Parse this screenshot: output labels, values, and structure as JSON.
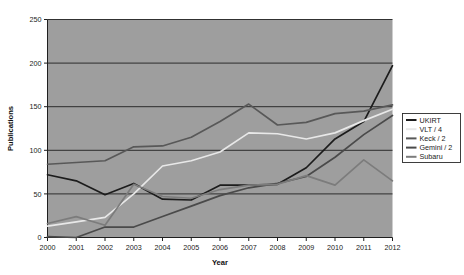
{
  "chart_data": {
    "type": "line",
    "title": "",
    "xlabel": "Year",
    "ylabel": "Publications",
    "x": [
      2000,
      2001,
      2002,
      2003,
      2004,
      2005,
      2006,
      2007,
      2008,
      2009,
      2010,
      2011,
      2012
    ],
    "categories": [
      "2000",
      "2001",
      "2002",
      "2003",
      "2004",
      "2005",
      "2006",
      "2007",
      "2008",
      "2009",
      "2010",
      "2011",
      "2012"
    ],
    "xlim": [
      2000,
      2012
    ],
    "ylim": [
      0,
      250
    ],
    "yticks": [
      0,
      50,
      100,
      150,
      200,
      250
    ],
    "ytick_labels": [
      "0",
      "50",
      "100",
      "150",
      "200",
      "250"
    ],
    "grid": true,
    "grid_axis": "y",
    "legend_position": "right",
    "plot_background": "#9e9e9e",
    "figure_background": "#ffffff",
    "series": [
      {
        "name": "UKIRT",
        "color": "#1c1c1c",
        "values": [
          72,
          65,
          49,
          62,
          44,
          43,
          60,
          60,
          61,
          80,
          113,
          133,
          197
        ]
      },
      {
        "name": "VLT / 4",
        "color": "#e8e8e8",
        "values": [
          13,
          18,
          23,
          50,
          82,
          88,
          98,
          120,
          119,
          113,
          120,
          134,
          147
        ]
      },
      {
        "name": "Keck / 2",
        "color": "#585858",
        "values": [
          84,
          86,
          88,
          104,
          105,
          115,
          133,
          153,
          129,
          132,
          142,
          145,
          152
        ]
      },
      {
        "name": "Gemini / 2",
        "color": "#4a4a4a",
        "values": [
          1,
          0,
          12,
          12,
          24,
          36,
          48,
          57,
          62,
          70,
          92,
          118,
          140
        ]
      },
      {
        "name": "Subaru",
        "color": "#7c7c7c",
        "values": [
          16,
          24,
          14,
          61,
          47,
          45,
          55,
          60,
          61,
          71,
          60,
          89,
          65
        ]
      }
    ]
  },
  "legend": {
    "entries": [
      {
        "label": "UKIRT",
        "color": "#1c1c1c"
      },
      {
        "label": "VLT / 4",
        "color": "#e8e8e8"
      },
      {
        "label": "Keck / 2",
        "color": "#585858"
      },
      {
        "label": "Gemini / 2",
        "color": "#4a4a4a"
      },
      {
        "label": "Subaru",
        "color": "#7c7c7c"
      }
    ]
  }
}
